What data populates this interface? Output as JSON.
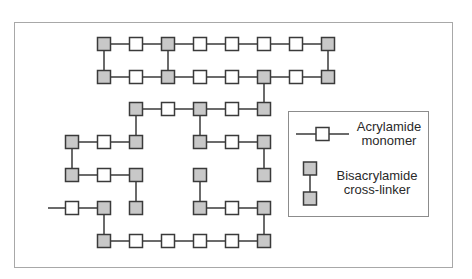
{
  "diagram": {
    "colors": {
      "monomer_fill": "#ffffff",
      "crosslinker_fill": "#c8c8c8",
      "stroke": "#3a3a3a",
      "frame": "#a8a8a8"
    },
    "grid": {
      "x0": 8,
      "dx": 32,
      "rows_y": [
        44,
        77,
        109,
        142,
        175,
        208,
        241
      ],
      "size": 13
    },
    "nodes": [
      {
        "r": 0,
        "c": 3,
        "t": "B"
      },
      {
        "r": 0,
        "c": 4,
        "t": "A"
      },
      {
        "r": 0,
        "c": 5,
        "t": "B"
      },
      {
        "r": 0,
        "c": 6,
        "t": "A"
      },
      {
        "r": 0,
        "c": 7,
        "t": "A"
      },
      {
        "r": 0,
        "c": 8,
        "t": "A"
      },
      {
        "r": 0,
        "c": 9,
        "t": "A"
      },
      {
        "r": 0,
        "c": 10,
        "t": "B"
      },
      {
        "r": 1,
        "c": 3,
        "t": "B"
      },
      {
        "r": 1,
        "c": 4,
        "t": "A"
      },
      {
        "r": 1,
        "c": 5,
        "t": "B"
      },
      {
        "r": 1,
        "c": 6,
        "t": "A"
      },
      {
        "r": 1,
        "c": 7,
        "t": "A"
      },
      {
        "r": 1,
        "c": 8,
        "t": "B"
      },
      {
        "r": 1,
        "c": 9,
        "t": "A"
      },
      {
        "r": 1,
        "c": 10,
        "t": "B"
      },
      {
        "r": 2,
        "c": 4,
        "t": "B"
      },
      {
        "r": 2,
        "c": 5,
        "t": "A"
      },
      {
        "r": 2,
        "c": 6,
        "t": "B"
      },
      {
        "r": 2,
        "c": 7,
        "t": "A"
      },
      {
        "r": 2,
        "c": 8,
        "t": "B"
      },
      {
        "r": 3,
        "c": 2,
        "t": "B"
      },
      {
        "r": 3,
        "c": 3,
        "t": "A"
      },
      {
        "r": 3,
        "c": 4,
        "t": "B"
      },
      {
        "r": 3,
        "c": 6,
        "t": "B"
      },
      {
        "r": 3,
        "c": 7,
        "t": "A"
      },
      {
        "r": 3,
        "c": 8,
        "t": "B"
      },
      {
        "r": 4,
        "c": 2,
        "t": "B"
      },
      {
        "r": 4,
        "c": 3,
        "t": "A"
      },
      {
        "r": 4,
        "c": 4,
        "t": "B"
      },
      {
        "r": 4,
        "c": 6,
        "t": "B"
      },
      {
        "r": 4,
        "c": 8,
        "t": "B"
      },
      {
        "r": 5,
        "c": 2,
        "t": "A"
      },
      {
        "r": 5,
        "c": 3,
        "t": "B"
      },
      {
        "r": 5,
        "c": 4,
        "t": "B"
      },
      {
        "r": 5,
        "c": 6,
        "t": "B"
      },
      {
        "r": 5,
        "c": 7,
        "t": "A"
      },
      {
        "r": 5,
        "c": 8,
        "t": "B"
      },
      {
        "r": 6,
        "c": 3,
        "t": "B"
      },
      {
        "r": 6,
        "c": 4,
        "t": "A"
      },
      {
        "r": 6,
        "c": 5,
        "t": "A"
      },
      {
        "r": 6,
        "c": 6,
        "t": "A"
      },
      {
        "r": 6,
        "c": 7,
        "t": "A"
      },
      {
        "r": 6,
        "c": 8,
        "t": "B"
      }
    ],
    "h_links": [
      [
        0,
        3,
        10
      ],
      [
        1,
        3,
        10
      ],
      [
        2,
        4,
        8
      ],
      [
        3,
        2,
        4
      ],
      [
        3,
        6,
        8
      ],
      [
        4,
        2,
        4
      ],
      [
        5,
        2,
        3
      ],
      [
        5,
        6,
        8
      ],
      [
        6,
        3,
        8
      ]
    ],
    "v_links": [
      [
        3,
        0,
        1
      ],
      [
        5,
        0,
        1
      ],
      [
        10,
        0,
        1
      ],
      [
        8,
        1,
        2
      ],
      [
        4,
        2,
        3
      ],
      [
        6,
        2,
        3
      ],
      [
        2,
        3,
        4
      ],
      [
        8,
        3,
        4
      ],
      [
        4,
        4,
        5
      ],
      [
        6,
        4,
        5
      ],
      [
        3,
        5,
        6
      ],
      [
        8,
        5,
        6
      ]
    ],
    "free_tail": {
      "x1": 48,
      "x2": 66,
      "y": 208
    }
  },
  "legend": {
    "monomer_label": "Acrylamide monomer",
    "monomer_line1": "Acrylamide",
    "monomer_line2": "monomer",
    "crosslinker_line1": "Bisacrylamide",
    "crosslinker_line2": "cross-linker"
  }
}
